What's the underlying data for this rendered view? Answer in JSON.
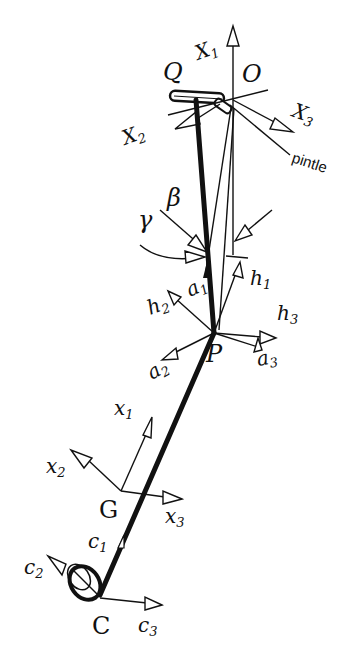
{
  "points": {
    "Q": "Q",
    "O": "O",
    "P": "P",
    "G": "G",
    "C": "C"
  },
  "global_axes": {
    "X1": "X",
    "X1_sub": "1",
    "X2": "X",
    "X2_sub": "2",
    "X3": "X",
    "X3_sub": "3"
  },
  "pintle_label": "pintle",
  "angles": {
    "beta": "β",
    "gamma": "γ"
  },
  "P_frame": {
    "a1": "a",
    "a1_sub": "1",
    "a2": "a",
    "a2_sub": "2",
    "a3": "a",
    "a3_sub": "3",
    "h1": "h",
    "h1_sub": "1",
    "h2": "h",
    "h2_sub": "2",
    "h3": "h",
    "h3_sub": "3"
  },
  "G_frame": {
    "x1": "x",
    "x1_sub": "1",
    "x2": "x",
    "x2_sub": "2",
    "x3": "x",
    "x3_sub": "3"
  },
  "C_frame": {
    "c1": "c",
    "c1_sub": "1",
    "c2": "c",
    "c2_sub": "2",
    "c3": "c",
    "c3_sub": "3"
  },
  "colors": {
    "ink": "#111111",
    "background": "#ffffff"
  }
}
